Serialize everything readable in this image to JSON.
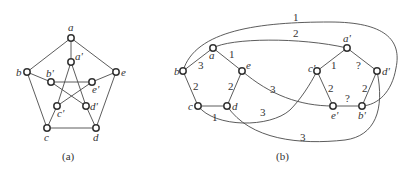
{
  "figure_a": {
    "caption": "(a)",
    "graph": "Petersen graph",
    "nodes": [
      {
        "id": "a",
        "label": "a",
        "x": 71,
        "y": 38
      },
      {
        "id": "b",
        "label": "b",
        "x": 27,
        "y": 72
      },
      {
        "id": "c",
        "label": "c",
        "x": 47,
        "y": 128
      },
      {
        "id": "d",
        "label": "d",
        "x": 96,
        "y": 128
      },
      {
        "id": "e",
        "label": "e",
        "x": 116,
        "y": 72
      },
      {
        "id": "a'",
        "label": "a'",
        "x": 71,
        "y": 62
      },
      {
        "id": "b'",
        "label": "b'",
        "x": 51,
        "y": 82
      },
      {
        "id": "c'",
        "label": "c'",
        "x": 57,
        "y": 106
      },
      {
        "id": "d'",
        "label": "d'",
        "x": 86,
        "y": 106
      },
      {
        "id": "e'",
        "label": "e'",
        "x": 92,
        "y": 82
      }
    ],
    "edges": [
      [
        "a",
        "b"
      ],
      [
        "b",
        "c"
      ],
      [
        "c",
        "d"
      ],
      [
        "d",
        "e"
      ],
      [
        "e",
        "a"
      ],
      [
        "a",
        "a'"
      ],
      [
        "b",
        "b'"
      ],
      [
        "c",
        "c'"
      ],
      [
        "d",
        "d'"
      ],
      [
        "e",
        "e'"
      ],
      [
        "a'",
        "c'"
      ],
      [
        "a'",
        "d'"
      ],
      [
        "b'",
        "e'"
      ],
      [
        "b'",
        "d'"
      ],
      [
        "c'",
        "e'"
      ]
    ]
  },
  "figure_b": {
    "caption": "(b)",
    "nodes": [
      {
        "id": "a",
        "label": "a",
        "x": 213,
        "y": 48
      },
      {
        "id": "b",
        "label": "b",
        "x": 183,
        "y": 71
      },
      {
        "id": "c",
        "label": "c",
        "x": 198,
        "y": 106
      },
      {
        "id": "d",
        "label": "d",
        "x": 227,
        "y": 106
      },
      {
        "id": "e",
        "label": "e",
        "x": 242,
        "y": 71
      },
      {
        "id": "a'",
        "label": "a'",
        "x": 347,
        "y": 48
      },
      {
        "id": "c'",
        "label": "c'",
        "x": 317,
        "y": 71
      },
      {
        "id": "d'",
        "label": "d'",
        "x": 377,
        "y": 71
      },
      {
        "id": "e'",
        "label": "e'",
        "x": 333,
        "y": 106
      },
      {
        "id": "b'",
        "label": "b'",
        "x": 362,
        "y": 106
      }
    ],
    "edge_labels": {
      "a_e": "1",
      "a_b": "3",
      "b_c": "2",
      "e_d": "2",
      "c_d": "1",
      "b_dprime_outer": "1",
      "a_aprime": "2",
      "e_bprime": "3",
      "c_cprime": "3",
      "d_dprime": "3",
      "aprime_cprime": "1",
      "aprime_dprime": "?",
      "cprime_eprime": "2",
      "dprime_bprime": "2",
      "eprime_bprime": "?"
    }
  }
}
